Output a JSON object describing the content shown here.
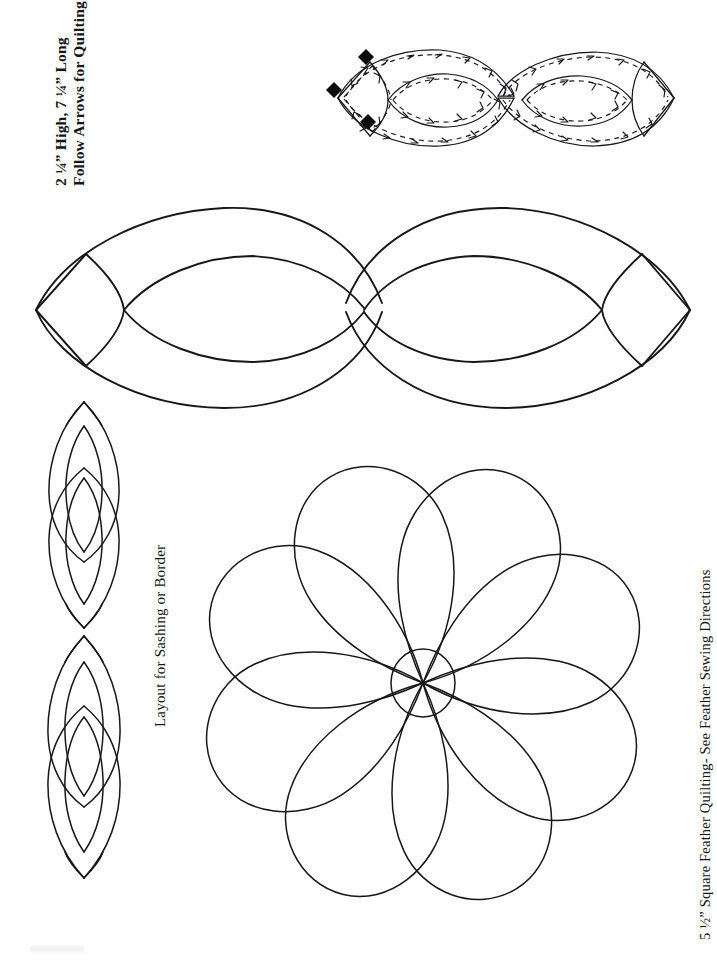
{
  "document": {
    "kind": "quilting-pattern-template",
    "background_color": "#fefefe",
    "ink_color": "#17171b"
  },
  "labels": {
    "top_left": {
      "name": "dimensions-and-instruction-label",
      "rotation_degrees": -90,
      "line1": "2 ¼” High, 7 ¼” Long",
      "line2": "Follow Arrows for Quilting"
    },
    "middle_left": {
      "name": "layout-label",
      "rotation_degrees": -90,
      "text": "Layout for Sashing or Border"
    },
    "right_side": {
      "name": "square-and-feather-label",
      "rotation_degrees": -90,
      "text": "5 ½” Square   Feather Quilting- See Feather Sewing Directions"
    }
  },
  "figures": {
    "arrow_diagram": {
      "name": "stitch-direction-diagram",
      "description": "Double-lens infinity motif overlaid with dashed sewing path and directional arrowheads",
      "lobes": 2,
      "start_markers": 3,
      "start_marker_shape": "diamond",
      "start_marker_color": "#0d0d10",
      "has_dashed_path": true,
      "has_arrowheads": true
    },
    "large_outline": {
      "name": "large-double-lens-pattern",
      "description": "Full-size two-lobe infinity outline with inner lens curves and end caps",
      "lobes": 2,
      "orientation": "horizontal"
    },
    "sashing_motifs": {
      "name": "sashing-border-motif",
      "description": "Vertical two-lobe lens motifs shown stacked for sashing or border layout",
      "count": 2,
      "orientation": "vertical",
      "lobes_each": 2
    },
    "feather_flower": {
      "name": "feather-flower-pattern",
      "description": "Pinwheel feather wreath of teardrop petals spiralling around a center circle",
      "petals": 8,
      "has_center_circle": true,
      "spiral_direction": "counterclockwise"
    }
  }
}
